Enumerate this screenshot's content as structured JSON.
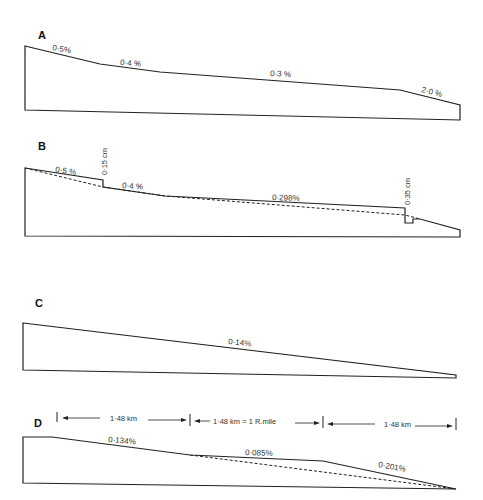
{
  "figure": {
    "panels": [
      {
        "id": "A",
        "label": "A",
        "slopes": [
          "0·5%",
          "0·4 %",
          "0·3 %",
          "2·0 %"
        ]
      },
      {
        "id": "B",
        "label": "B",
        "slopes": [
          "0·5 %",
          "0·4 %",
          "0·298%"
        ],
        "steps": [
          "0·15 cm",
          "0·35 cm"
        ]
      },
      {
        "id": "C",
        "label": "C",
        "slopes": [
          "0·14%"
        ]
      },
      {
        "id": "D",
        "label": "D",
        "slopes": [
          "0·134%",
          "0·085%",
          "0·201%"
        ],
        "distances": [
          "1·48 km",
          "1·48 km = 1 R.mile",
          "1·48 km"
        ]
      }
    ]
  }
}
